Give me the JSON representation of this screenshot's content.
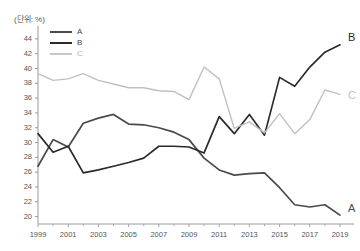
{
  "unit_note": "(단위: %)",
  "legend": {
    "position": "top-left-inside",
    "items": [
      {
        "label": "A",
        "color": "#4a4a4a",
        "name": "legend-item-a"
      },
      {
        "label": "B",
        "color": "#2b2b2b",
        "name": "legend-item-b"
      },
      {
        "label": "C",
        "color": "#c0c0c0",
        "name": "legend-item-c"
      }
    ]
  },
  "end_labels": [
    {
      "label": "B",
      "color": "#2b2b2b"
    },
    {
      "label": "C",
      "color": "#b5b5b5"
    },
    {
      "label": "A",
      "color": "#4a4a4a"
    }
  ],
  "axis": {
    "y_ticks": [
      "44",
      "42",
      "40",
      "38",
      "36",
      "34",
      "32",
      "30",
      "28",
      "26",
      "24",
      "22",
      "20"
    ],
    "x_ticks": [
      "1999",
      "2001",
      "2003",
      "2005",
      "2007",
      "2009",
      "2011",
      "2013",
      "2015",
      "2017",
      "2019"
    ]
  },
  "chart_data": {
    "type": "line",
    "title": "",
    "xlabel": "",
    "ylabel": "",
    "unit": "%",
    "grid": false,
    "legend_position": "top-left",
    "ylim": [
      19,
      45
    ],
    "xlim": [
      1999,
      2019
    ],
    "y_tick_values": [
      44,
      42,
      40,
      38,
      36,
      34,
      32,
      30,
      28,
      26,
      24,
      22,
      20
    ],
    "x_tick_values": [
      1999,
      2001,
      2003,
      2005,
      2007,
      2009,
      2011,
      2013,
      2015,
      2017,
      2019
    ],
    "x": [
      1999,
      2000,
      2001,
      2002,
      2003,
      2004,
      2005,
      2006,
      2007,
      2008,
      2009,
      2010,
      2011,
      2012,
      2013,
      2014,
      2015,
      2016,
      2017,
      2018,
      2019
    ],
    "series": [
      {
        "name": "A",
        "color": "#4a4a4a",
        "values": [
          26.8,
          30.4,
          29.4,
          32.6,
          33.3,
          33.8,
          32.5,
          32.4,
          32.0,
          31.4,
          30.4,
          27.9,
          26.3,
          25.6,
          25.8,
          25.9,
          23.9,
          21.6,
          21.3,
          21.6,
          20.2
        ]
      },
      {
        "name": "B",
        "color": "#2b2b2b",
        "values": [
          31.2,
          28.7,
          29.5,
          25.9,
          26.3,
          26.8,
          27.3,
          27.9,
          29.5,
          29.5,
          29.4,
          28.6,
          33.5,
          31.2,
          33.8,
          31.0,
          38.8,
          37.6,
          40.2,
          42.2,
          43.2
        ]
      },
      {
        "name": "C",
        "color": "#c0c0c0",
        "values": [
          39.3,
          38.4,
          38.6,
          39.3,
          38.4,
          37.9,
          37.4,
          37.4,
          37.0,
          36.9,
          35.8,
          40.2,
          38.6,
          31.9,
          32.8,
          31.3,
          33.9,
          31.2,
          33.1,
          37.1,
          36.5
        ]
      }
    ]
  }
}
